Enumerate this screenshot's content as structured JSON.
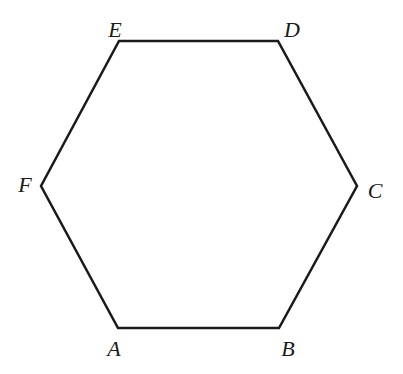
{
  "figure": {
    "type": "geometric-diagram",
    "shape": "regular-hexagon",
    "background_color": "#ffffff",
    "stroke_color": "#1a1a1a",
    "stroke_width": 2.5,
    "width": 403,
    "height": 374
  },
  "labels": {
    "a": "A",
    "b": "B",
    "c": "C",
    "d": "D",
    "e": "E",
    "f": "F"
  },
  "chart_data": {
    "type": "scatter",
    "title": "",
    "xlabel": "",
    "ylabel": "",
    "xlim": [
      0,
      403
    ],
    "ylim": [
      374,
      0
    ],
    "grid": false,
    "legend": "none",
    "annotations": [
      "A",
      "B",
      "C",
      "D",
      "E",
      "F"
    ],
    "vertices": [
      {
        "name": "A",
        "x": 118,
        "y": 328,
        "label_x": 114,
        "label_y": 349
      },
      {
        "name": "B",
        "x": 279,
        "y": 328,
        "label_x": 288,
        "label_y": 349
      },
      {
        "name": "C",
        "x": 357,
        "y": 186,
        "label_x": 375,
        "label_y": 191
      },
      {
        "name": "D",
        "x": 278,
        "y": 41,
        "label_x": 292,
        "label_y": 30
      },
      {
        "name": "E",
        "x": 119,
        "y": 41,
        "label_x": 115,
        "label_y": 30
      },
      {
        "name": "F",
        "x": 41,
        "y": 186,
        "label_x": 25,
        "label_y": 185
      }
    ],
    "edges": [
      {
        "from": "A",
        "to": "B"
      },
      {
        "from": "B",
        "to": "C"
      },
      {
        "from": "C",
        "to": "D"
      },
      {
        "from": "D",
        "to": "E"
      },
      {
        "from": "E",
        "to": "F"
      },
      {
        "from": "F",
        "to": "A"
      }
    ],
    "polygon_points": "118,328 279,328 357,186 278,41 119,41 41,186"
  }
}
